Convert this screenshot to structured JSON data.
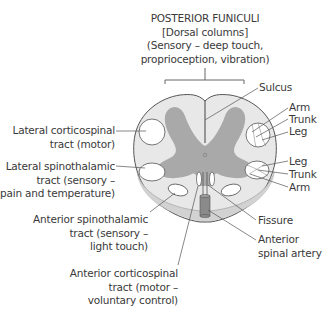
{
  "title": {
    "line1": "POSTERIOR FUNICULI",
    "line2": "[Dorsal columns]",
    "line3": "(Sensory – deep touch,",
    "line4": "proprioception, vibration)"
  },
  "labels": {
    "sulcus": "Sulcus",
    "upper_arm": "Arm",
    "upper_trunk": "Trunk",
    "upper_leg": "Leg",
    "lower_leg": "Leg",
    "lower_trunk": "Trunk",
    "lower_arm": "Arm",
    "lateral_corticospinal_1": "Lateral corticospinal",
    "lateral_corticospinal_2": "tract (motor)",
    "lateral_spinothalamic_1": "Lateral spinothalamic",
    "lateral_spinothalamic_2": "tract (sensory –",
    "lateral_spinothalamic_3": "pain and temperature)",
    "anterior_spinothalamic_1": "Anterior spinothalamic",
    "anterior_spinothalamic_2": "tract (sensory –",
    "anterior_spinothalamic_3": "light touch)",
    "fissure": "Fissure",
    "anterior_artery_1": "Anterior",
    "anterior_artery_2": "spinal artery",
    "anterior_corticospinal_1": "Anterior corticospinal",
    "anterior_corticospinal_2": "tract (motor –",
    "anterior_corticospinal_3": "voluntary control)"
  },
  "colors": {
    "white_matter": "#e6e6e6",
    "gray_matter": "#a9a9a9",
    "outline": "#555555",
    "tract_fill": "#ffffff",
    "lower_rim": "#cfcfcf",
    "artery": "#8a8a8a"
  }
}
